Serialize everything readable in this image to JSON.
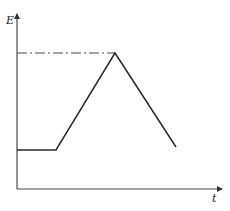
{
  "diagram": {
    "y_axis_label": "E",
    "x_axis_label": "t",
    "colors": {
      "line": "#2a2a2a",
      "axis": "#4a4a4a",
      "background": "#ffffff"
    },
    "curve": {
      "description": "Piecewise linear E vs t: flat low level, linear rise to a peak, linear fall",
      "points": [
        [
          17,
          150
        ],
        [
          56,
          150
        ],
        [
          115,
          53
        ],
        [
          176,
          147
        ]
      ]
    },
    "reference_line": {
      "style": "dash-dot",
      "y": 53,
      "x_start": 17,
      "x_end": 115
    }
  }
}
